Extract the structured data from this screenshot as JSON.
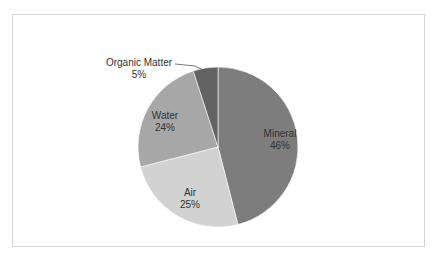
{
  "chart_data": {
    "type": "pie",
    "title": "",
    "categories": [
      "Mineral",
      "Air",
      "Water",
      "Organic Matter"
    ],
    "values": [
      46,
      25,
      24,
      5
    ],
    "labels": [
      "Mineral\n46%",
      "Air\n25%",
      "Water\n24%",
      "Organic Matter\n5%"
    ],
    "colors": [
      "#7d7d7d",
      "#d2d2d2",
      "#a7a7a7",
      "#626262"
    ],
    "start_angle": "12 o'clock",
    "direction": "clockwise",
    "legend": "none"
  },
  "labels": {
    "mineral": {
      "name": "Mineral",
      "pct": "46%"
    },
    "air": {
      "name": "Air",
      "pct": "25%"
    },
    "water": {
      "name": "Water",
      "pct": "24%"
    },
    "organic": {
      "name": "Organic Matter",
      "pct": "5%"
    }
  }
}
